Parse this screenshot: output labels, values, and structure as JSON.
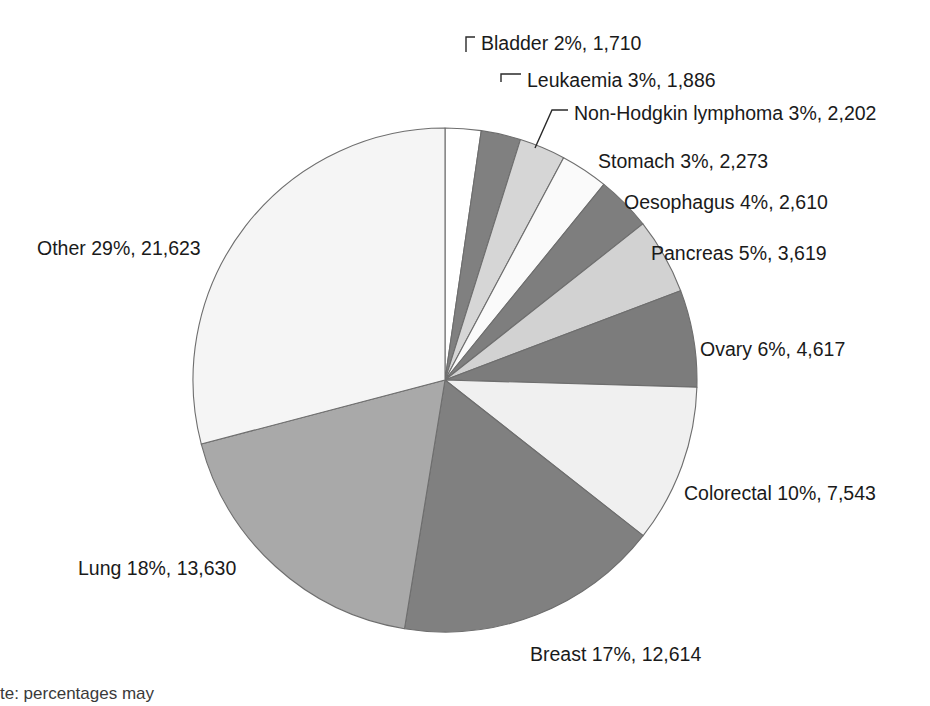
{
  "chart_data": {
    "type": "pie",
    "title": "",
    "subtitle": "",
    "xlabel": "",
    "ylabel": "",
    "legend_position": "none",
    "grid": false,
    "total": 74327,
    "units": "deaths",
    "start_angle_deg": 0,
    "direction": "clockwise",
    "center": {
      "x": 445,
      "y": 380
    },
    "radius": 252,
    "categories": [
      "Bladder",
      "Leukaemia",
      "Non-Hodgkin lymphoma",
      "Stomach",
      "Oesophagus",
      "Pancreas",
      "Ovary",
      "Colorectal",
      "Breast",
      "Lung",
      "Other"
    ],
    "values": [
      1710,
      1886,
      2202,
      2273,
      2610,
      3619,
      4617,
      7543,
      12614,
      13630,
      21623
    ],
    "percentages": [
      2,
      3,
      3,
      3,
      4,
      5,
      6,
      10,
      17,
      18,
      29
    ],
    "colors": [
      "#ffffff",
      "#808080",
      "#d6d6d6",
      "#fafafa",
      "#7e7e7e",
      "#d2d2d2",
      "#7c7c7c",
      "#f0f0f0",
      "#808080",
      "#a9a9a9",
      "#f5f5f5"
    ],
    "slice_border_color": "#6e6e6e",
    "slices": [
      {
        "name": "Bladder",
        "percent": 2,
        "value": 1710,
        "label": "Bladder 2%, 1,710",
        "color": "#ffffff",
        "label_x": 481,
        "label_y": 45,
        "label_anchor": "start",
        "leader": "M 466,52 L 466,37 L 475,37"
      },
      {
        "name": "Leukaemia",
        "percent": 3,
        "value": 1886,
        "label": "Leukaemia 3%, 1,886",
        "color": "#808080",
        "label_x": 527,
        "label_y": 82,
        "label_anchor": "start",
        "leader": "M 501,82 L 501,74 L 521,74"
      },
      {
        "name": "Non-Hodgkin lymphoma",
        "percent": 3,
        "value": 2202,
        "label": "Non-Hodgkin lymphoma 3%, 2,202",
        "color": "#d6d6d6",
        "label_x": 574,
        "label_y": 115,
        "label_anchor": "start",
        "leader": "M 535,148 L 552,110 L 568,110"
      },
      {
        "name": "Stomach",
        "percent": 3,
        "value": 2273,
        "label": "Stomach 3%, 2,273",
        "color": "#fafafa",
        "label_x": 598,
        "label_y": 163,
        "label_anchor": "start",
        "leader": ""
      },
      {
        "name": "Oesophagus",
        "percent": 4,
        "value": 2610,
        "label": "Oesophagus 4%, 2,610",
        "color": "#7e7e7e",
        "label_x": 624,
        "label_y": 204,
        "label_anchor": "start",
        "leader": ""
      },
      {
        "name": "Pancreas",
        "percent": 5,
        "value": 3619,
        "label": "Pancreas 5%, 3,619",
        "color": "#d2d2d2",
        "label_x": 651,
        "label_y": 255,
        "label_anchor": "start",
        "leader": ""
      },
      {
        "name": "Ovary",
        "percent": 6,
        "value": 4617,
        "label": "Ovary 6%, 4,617",
        "color": "#7c7c7c",
        "label_x": 700,
        "label_y": 351,
        "label_anchor": "start",
        "leader": ""
      },
      {
        "name": "Colorectal",
        "percent": 10,
        "value": 7543,
        "label": "Colorectal 10%, 7,543",
        "color": "#f0f0f0",
        "label_x": 684,
        "label_y": 495,
        "label_anchor": "start",
        "leader": ""
      },
      {
        "name": "Breast",
        "percent": 17,
        "value": 12614,
        "label": "Breast 17%, 12,614",
        "color": "#808080",
        "label_x": 530,
        "label_y": 656,
        "label_anchor": "start",
        "leader": ""
      },
      {
        "name": "Lung",
        "percent": 18,
        "value": 13630,
        "label": "Lung 18%, 13,630",
        "color": "#a9a9a9",
        "label_x": 78,
        "label_y": 570,
        "label_anchor": "start",
        "leader": ""
      },
      {
        "name": "Other",
        "percent": 29,
        "value": 21623,
        "label": "Other 29%, 21,623",
        "color": "#f5f5f5",
        "label_x": 37,
        "label_y": 250,
        "label_anchor": "start",
        "leader": ""
      }
    ]
  },
  "footnote": {
    "text": "te: percentages may"
  }
}
